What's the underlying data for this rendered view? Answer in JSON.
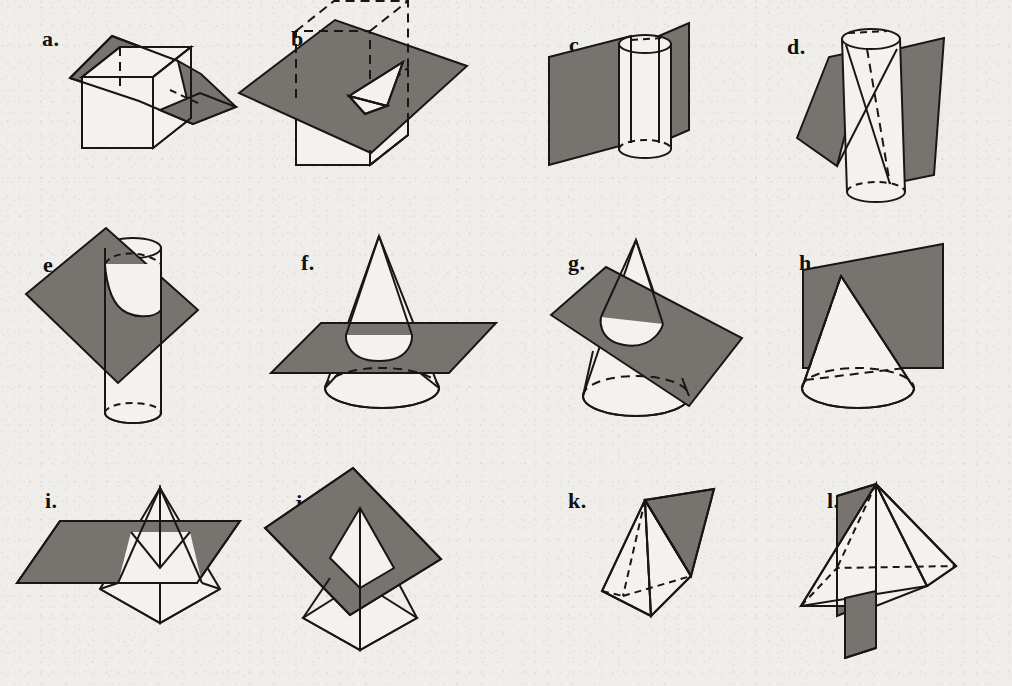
{
  "page": {
    "background_color": "#f0eeea",
    "ink_color": "#181716",
    "plane_fill_color": "#777470",
    "solid_fill_color": "#f4f2ef",
    "columns": 4,
    "rows": 3
  },
  "figures": [
    {
      "label": "a.",
      "solid": "cube",
      "plane": "oblique plane",
      "caption": "Plane cutting diagonally through a cube"
    },
    {
      "label": "b.",
      "solid": "cube",
      "plane": "oblique plane near top face",
      "caption": "Plane cutting a corner off a cube"
    },
    {
      "label": "c.",
      "solid": "cylinder",
      "plane": "vertical plane through axis",
      "caption": "Vertical plane through a cylinder"
    },
    {
      "label": "d.",
      "solid": "cylinder",
      "plane": "tilted plane",
      "caption": "Tilted plane cutting a cylinder"
    },
    {
      "label": "e.",
      "solid": "cylinder",
      "plane": "oblique diamond plane",
      "caption": "Oblique plane cutting a cylinder in an ellipse"
    },
    {
      "label": "f.",
      "solid": "cone",
      "plane": "horizontal plane",
      "caption": "Horizontal plane cutting a cone in a circle"
    },
    {
      "label": "g.",
      "solid": "cone",
      "plane": "tilted plane",
      "caption": "Tilted plane cutting a cone in an ellipse"
    },
    {
      "label": "h.",
      "solid": "cone",
      "plane": "vertical plane through apex",
      "caption": "Vertical plane through the apex of a cone"
    },
    {
      "label": "i.",
      "solid": "pyramid",
      "plane": "horizontal plane",
      "caption": "Horizontal plane cutting a square pyramid"
    },
    {
      "label": "j.",
      "solid": "pyramid",
      "plane": "tilted diamond plane",
      "caption": "Tilted plane cutting a square pyramid"
    },
    {
      "label": "k.",
      "solid": "pyramid",
      "plane": "plane through apex and base edge",
      "caption": "Plane through the apex of a pyramid"
    },
    {
      "label": "l.",
      "solid": "pyramid",
      "plane": "vertical plane through apex",
      "caption": "Vertical plane through apex and base diagonal"
    }
  ]
}
